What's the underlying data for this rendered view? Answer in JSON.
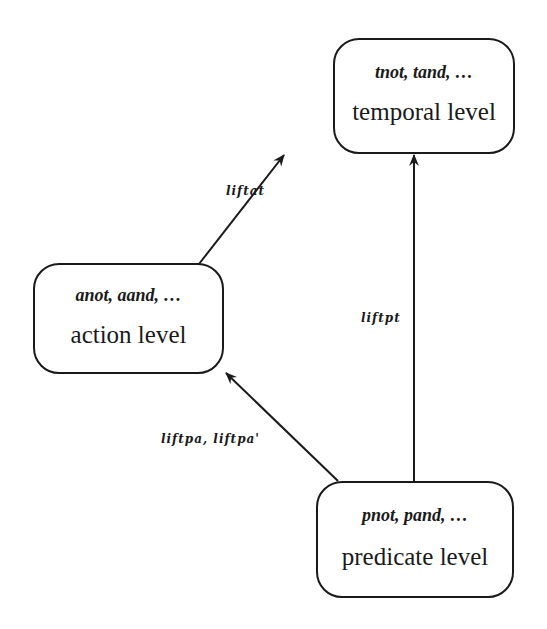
{
  "nodes": {
    "temporal": {
      "ops": "tnot, tand, …",
      "label": "temporal level"
    },
    "action": {
      "ops": "anot, aand, …",
      "label": "action level"
    },
    "predicate": {
      "ops": "pnot, pand, …",
      "label": "predicate level"
    }
  },
  "edges": {
    "action_to_temporal": {
      "label": "liftat",
      "from": "action",
      "to": "temporal"
    },
    "predicate_to_temporal": {
      "label": "liftpt",
      "from": "predicate",
      "to": "temporal"
    },
    "predicate_to_action": {
      "label": "liftpa, liftpa'",
      "from": "predicate",
      "to": "action"
    }
  },
  "colors": {
    "stroke": "#1a1a1a",
    "background": "#ffffff"
  }
}
